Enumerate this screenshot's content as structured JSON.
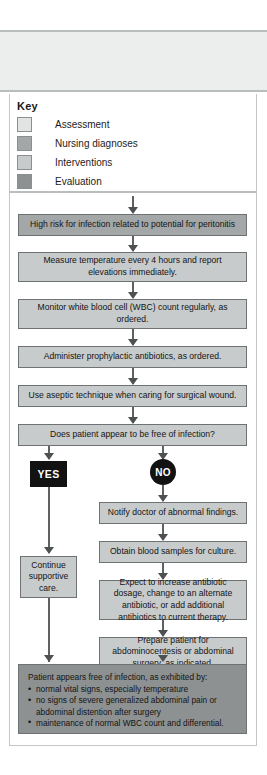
{
  "key": {
    "title": "Key",
    "items": [
      {
        "label": "Assessment",
        "color": "#e2e4e4"
      },
      {
        "label": "Nursing diagnoses",
        "color": "#a3a7a7"
      },
      {
        "label": "Interventions",
        "color": "#c8cbcb"
      },
      {
        "label": "Evaluation",
        "color": "#8d9191"
      }
    ]
  },
  "flow": {
    "nodes": [
      {
        "id": "diagnosis",
        "text": "High risk for infection related to potential for peritonitis",
        "category": "Nursing diagnoses"
      },
      {
        "id": "temperature",
        "text": "Measure temperature every 4 hours and report elevations immediately.",
        "category": "Interventions"
      },
      {
        "id": "wbc",
        "text": "Monitor white blood cell (WBC) count regularly, as ordered.",
        "category": "Interventions"
      },
      {
        "id": "antibiotics",
        "text": "Administer prophylactic antibiotics, as ordered.",
        "category": "Interventions"
      },
      {
        "id": "aseptic",
        "text": "Use aseptic technique when caring for surgical wound.",
        "category": "Interventions"
      },
      {
        "id": "decision",
        "text": "Does patient appear to be free of infection?",
        "category": "Interventions"
      },
      {
        "id": "continue",
        "text": "Continue supportive care.",
        "category": "Interventions"
      },
      {
        "id": "notify",
        "text": "Notify doctor of abnormal findings.",
        "category": "Interventions"
      },
      {
        "id": "blood",
        "text": "Obtain blood samples for culture.",
        "category": "Interventions"
      },
      {
        "id": "dosage",
        "text": "Expect to increase antibiotic dosage, change to an alternate antibiotic, or add additional antibiotics to current therapy.",
        "category": "Interventions"
      },
      {
        "id": "prepare",
        "text": "Prepare patient for abdominocentesis or abdominal surgery, as indicated.",
        "category": "Interventions"
      }
    ],
    "branches": {
      "yes_label": "YES",
      "no_label": "NO"
    },
    "evaluation": {
      "lead": "Patient appears free of infection, as exhibited by:",
      "bullets": [
        "normal vital signs, especially temperature",
        "no signs of severe generalized abdominal pain or abdominal distention after surgery",
        "maintenance of normal WBC count and differential."
      ],
      "category": "Evaluation"
    }
  },
  "colors": {
    "assessment": "#e2e4e4",
    "nursing_diagnoses": "#a3a7a7",
    "interventions": "#c8cbcb",
    "evaluation": "#8d9191",
    "connector": "#5d6161",
    "badge": "#121212"
  }
}
